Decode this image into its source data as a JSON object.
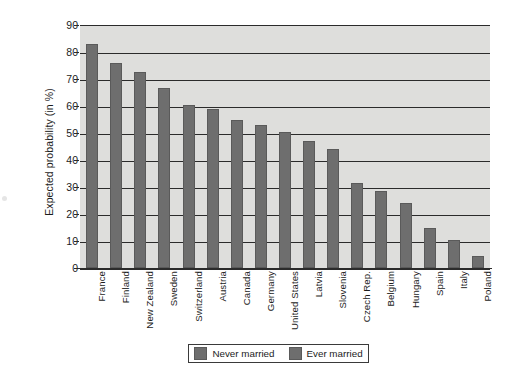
{
  "chart_data": {
    "type": "bar",
    "title": "",
    "xlabel": "",
    "ylabel": "Expected probability (in %)",
    "ylim": [
      0,
      90
    ],
    "ytick_step": 10,
    "yticks": [
      90,
      80,
      70,
      60,
      50,
      40,
      30,
      20,
      10,
      0
    ],
    "grid": true,
    "legend_position": "bottom-center",
    "categories": [
      "France",
      "Finland",
      "New Zealand",
      "Sweden",
      "Switzerland",
      "Austria",
      "Canada",
      "Germany",
      "United States",
      "Latvia",
      "Slovenia",
      "Czech Rep.",
      "Belgium",
      "Hungary",
      "Spain",
      "Italy",
      "Poland"
    ],
    "series": [
      {
        "name": "Never married",
        "color": "#6e6e6e",
        "values": [
          83,
          76,
          72.5,
          66.5,
          60.5,
          59,
          55,
          53,
          50.5,
          47,
          44,
          31.5,
          28.5,
          24,
          15,
          10.5,
          4.5
        ]
      }
    ],
    "legend": [
      {
        "label": "Never married",
        "color": "#6e6e6e"
      },
      {
        "label": "Ever married",
        "color": "#6e6e6e"
      }
    ]
  },
  "axis": {
    "y_title": "Expected probability (in %)"
  },
  "colors": {
    "bar": "#6e6e6e",
    "plot_background": "#dededc",
    "axis": "#2b2b2b",
    "page_background": "#ffffff"
  }
}
